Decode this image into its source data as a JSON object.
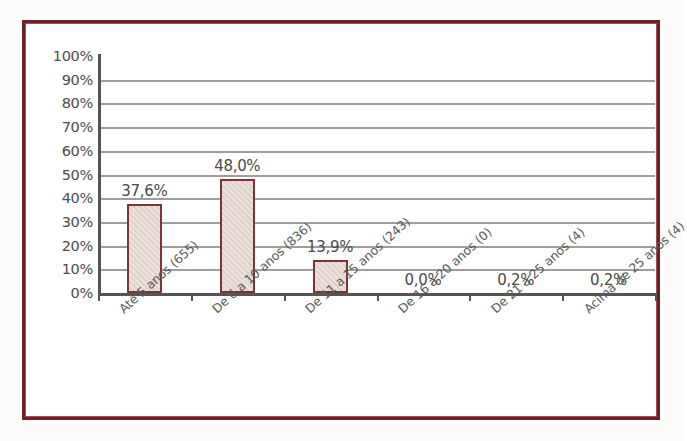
{
  "chart_data": {
    "type": "bar",
    "title": "",
    "xlabel": "",
    "ylabel": "",
    "grid": true,
    "legend": "none",
    "ylim": [
      0,
      100
    ],
    "ytick_labels": [
      "100%",
      "90%",
      "80%",
      "70%",
      "60%",
      "50%",
      "40%",
      "30%",
      "20%",
      "10%",
      "0%"
    ],
    "ytick_values": [
      100,
      90,
      80,
      70,
      60,
      50,
      40,
      30,
      20,
      10,
      0
    ],
    "categories": [
      "Até 5 anos (655)",
      "De 6 a 10 anos (836)",
      "De 11 a 15 anos (243)",
      "De 16 a 20 anos (0)",
      "De 21 a 25 anos (4)",
      "Acima de 25 anos (4)"
    ],
    "values": [
      37.6,
      48.0,
      13.9,
      0.0,
      0.2,
      0.2
    ],
    "counts": [
      655,
      836,
      243,
      0,
      4,
      4
    ],
    "data_labels": [
      "37,6%",
      "48,0%",
      "13,9%",
      "0,0%",
      "0,2%",
      "0,2%"
    ]
  },
  "style": {
    "frame_color": "#6d2026",
    "bar_fill": "#e0d2ca",
    "bar_border": "#7d3338",
    "gridline_color": "#8d8d8d",
    "axis_color": "#555555",
    "text_color": "#4a4a4a",
    "background": "#ffffff"
  }
}
